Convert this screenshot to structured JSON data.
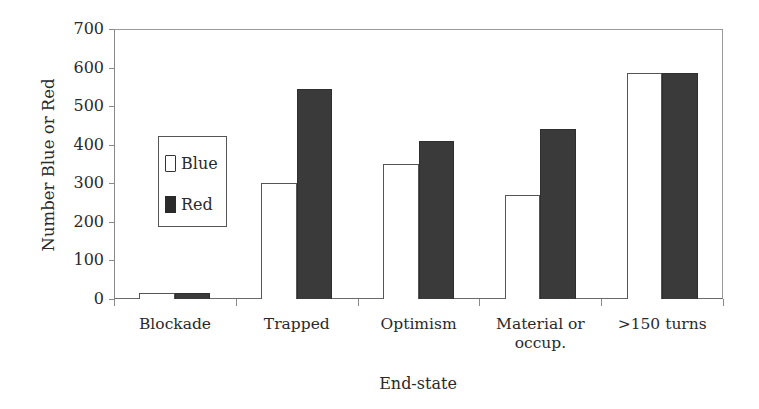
{
  "chart_data": {
    "type": "bar",
    "title": "",
    "xlabel": "End-state",
    "ylabel": "Number Blue or Red",
    "ylim": [
      0,
      700
    ],
    "yticks": [
      0,
      100,
      200,
      300,
      400,
      500,
      600,
      700
    ],
    "categories": [
      "Blockade",
      "Trapped",
      "Optimism",
      "Material or occup.",
      ">150 turns"
    ],
    "category_lines": [
      [
        "Blockade"
      ],
      [
        "Trapped"
      ],
      [
        "Optimism"
      ],
      [
        "Material or",
        "occup."
      ],
      [
        ">150 turns"
      ]
    ],
    "series": [
      {
        "name": "Blue",
        "color": "#ffffff",
        "values": [
          15,
          300,
          350,
          270,
          585
        ]
      },
      {
        "name": "Red",
        "color": "#3a3a3a",
        "values": [
          15,
          545,
          410,
          440,
          585
        ]
      }
    ],
    "legend": {
      "position": "inside-left",
      "entries": [
        "Blue",
        "Red"
      ]
    },
    "grid": false
  }
}
